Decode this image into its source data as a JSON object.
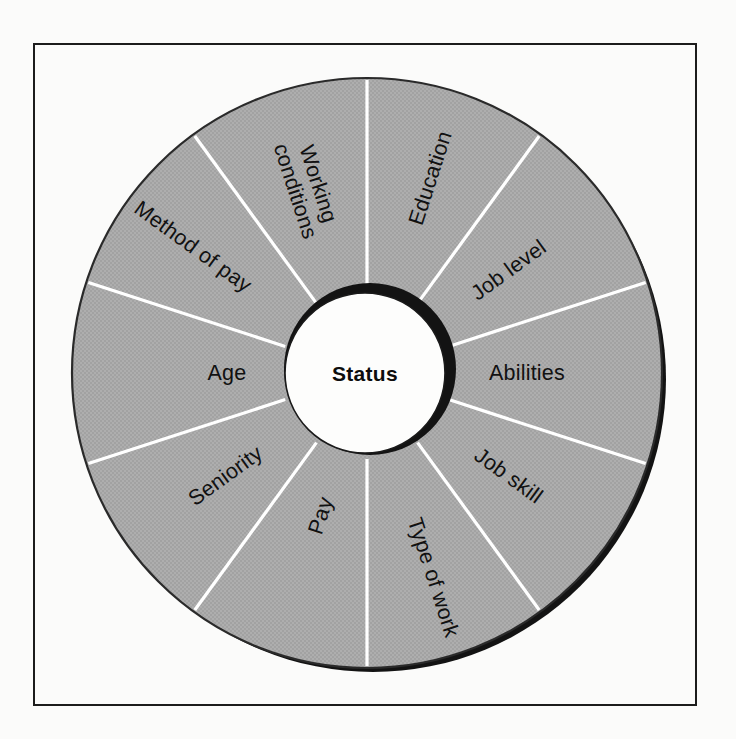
{
  "figure": {
    "center_label": "Status",
    "frame": {
      "visible": true,
      "color": "#1c1c1c"
    }
  },
  "colors": {
    "sector_fill": "#a9a9a9",
    "divider": "#ffffff",
    "ring_black": "#131313",
    "outline": "#1c1c1c",
    "background": "#fbfbfa",
    "text": "#111111"
  },
  "chart_data": {
    "type": "pie",
    "title": "Status",
    "xlabel": "",
    "ylabel": "",
    "legend": "none",
    "grid": false,
    "hole_ratio": 0.27,
    "categories": [
      "Education",
      "Job level",
      "Abilities",
      "Job skill",
      "Type of work",
      "Pay",
      "Seniority",
      "Age",
      "Method of pay",
      "Working conditions"
    ],
    "values": [
      10,
      10,
      10,
      10,
      10,
      10,
      10,
      10,
      10,
      10
    ]
  },
  "sectors": [
    {
      "id": "education",
      "label": "Education",
      "lines": [
        "Education"
      ],
      "mid_angle_deg": -72,
      "orientation": "radial",
      "label_radius": 205
    },
    {
      "id": "job-level",
      "label": "Job level",
      "lines": [
        "Job level"
      ],
      "mid_angle_deg": -36,
      "orientation": "radial",
      "label_radius": 175
    },
    {
      "id": "abilities",
      "label": "Abilities",
      "lines": [
        "Abilities"
      ],
      "mid_angle_deg": 0,
      "orientation": "horizontal",
      "label_radius": 160
    },
    {
      "id": "job-skill",
      "label": "Job skill",
      "lines": [
        "Job skill"
      ],
      "mid_angle_deg": 36,
      "orientation": "radial",
      "label_radius": 175
    },
    {
      "id": "type-of-work",
      "label": "Type of work",
      "lines": [
        "Type of work"
      ],
      "mid_angle_deg": 72,
      "orientation": "radial",
      "label_radius": 215
    },
    {
      "id": "pay",
      "label": "Pay",
      "lines": [
        "Pay"
      ],
      "mid_angle_deg": 108,
      "orientation": "radial",
      "label_radius": 150
    },
    {
      "id": "seniority",
      "label": "Seniority",
      "lines": [
        "Seniority"
      ],
      "mid_angle_deg": 144,
      "orientation": "radial",
      "label_radius": 175
    },
    {
      "id": "age",
      "label": "Age",
      "lines": [
        "Age"
      ],
      "mid_angle_deg": 180,
      "orientation": "horizontal",
      "label_radius": 140
    },
    {
      "id": "method-of-pay",
      "label": "Method of pay",
      "lines": [
        "Method of pay"
      ],
      "mid_angle_deg": -144,
      "orientation": "radial",
      "label_radius": 215
    },
    {
      "id": "working-conditions",
      "label": "Working conditions",
      "lines": [
        "Working",
        "conditions"
      ],
      "mid_angle_deg": -108,
      "orientation": "radial",
      "label_radius": 195
    }
  ]
}
